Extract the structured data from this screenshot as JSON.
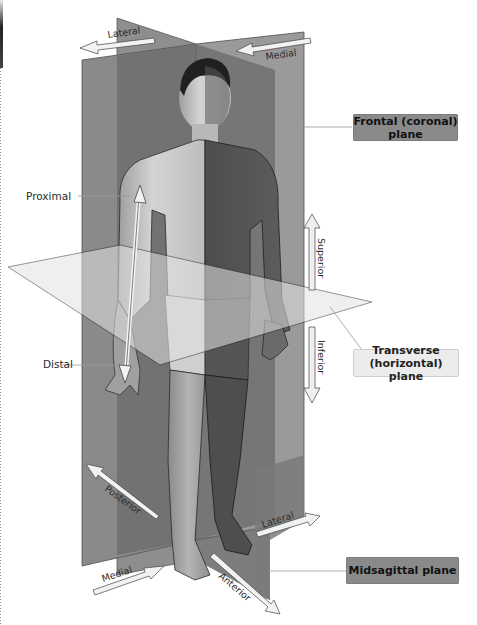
{
  "diagram": {
    "title_implied": "Anatomical planes and directional terms",
    "planes": [
      {
        "id": "frontal",
        "label_line1": "Frontal (coronal)",
        "label_line2": "plane"
      },
      {
        "id": "transverse",
        "label_line1": "Transverse",
        "label_line2": "(horizontal) plane"
      },
      {
        "id": "midsagittal",
        "label_line1": "Midsagittal plane"
      }
    ],
    "directional_terms": {
      "top_left": "Lateral",
      "top_right": "Medial",
      "proximal": "Proximal",
      "distal": "Distal",
      "superior": "Superior",
      "inferior": "Inferior",
      "posterior": "Posterior",
      "bottom_lateral": "Lateral",
      "bottom_medial": "Medial",
      "anterior": "Anterior"
    },
    "colors": {
      "plane_dark": "#6e6e6e",
      "plane_mid": "#8c8c8c",
      "plane_light": "#a8a8a8",
      "transverse_plane": "#d8d8d8",
      "label_dark_bg": "#8a8a8a",
      "label_light_bg": "#ececec",
      "arrow_fill": "#f2f2f2",
      "skin_light": "#c9c9c9",
      "skin_dark": "#585858"
    }
  }
}
